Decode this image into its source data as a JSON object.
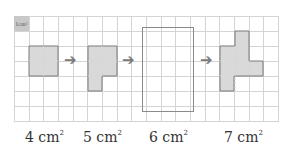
{
  "unit_label": "1cm²",
  "arrow_glyph": "➔",
  "labels": [
    {
      "value": "4 cm",
      "exp": "2"
    },
    {
      "value": "5 cm",
      "exp": "2"
    },
    {
      "value": "6 cm",
      "exp": "2"
    },
    {
      "value": "7 cm",
      "exp": "2"
    }
  ],
  "colors": {
    "fill": "#d9d9d9",
    "stroke": "#7a7a7a",
    "grid": "#d4d4d4"
  }
}
